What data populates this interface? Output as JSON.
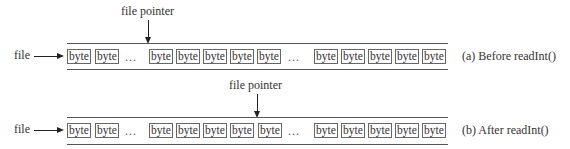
{
  "rows": [
    {
      "id": "before",
      "file_label": "file",
      "pointer_label": "file pointer",
      "caption": "(a) Before readInt()",
      "groups": [
        [
          "byte",
          "byte"
        ],
        [
          "byte",
          "byte",
          "byte",
          "byte",
          "byte"
        ],
        [
          "byte",
          "byte",
          "byte",
          "byte",
          "byte"
        ]
      ],
      "ellipsis": "...",
      "pointer_at": "before 1st byte of group 2"
    },
    {
      "id": "after",
      "file_label": "file",
      "pointer_label": "file pointer",
      "caption": "(b) After readInt()",
      "groups": [
        [
          "byte",
          "byte"
        ],
        [
          "byte",
          "byte",
          "byte",
          "byte",
          "byte"
        ],
        [
          "byte",
          "byte",
          "byte",
          "byte",
          "byte"
        ]
      ],
      "ellipsis": "...",
      "pointer_at": "before 5th byte of group 2"
    }
  ]
}
